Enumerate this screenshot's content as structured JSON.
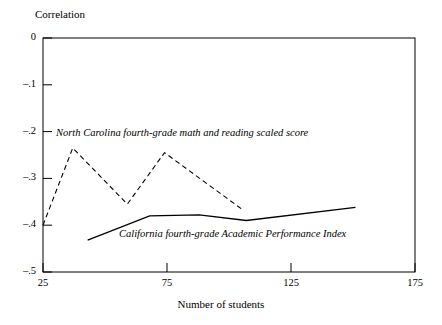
{
  "chart_data": {
    "type": "line",
    "title": "",
    "xlabel": "Number of students",
    "ylabel": "Correlation",
    "xlim": [
      25,
      175
    ],
    "ylim": [
      -0.5,
      0
    ],
    "grid": false,
    "legend_position": "inline-annotations",
    "xticks": [
      25,
      75,
      125,
      175
    ],
    "xtick_labels": [
      "25",
      "75",
      "125",
      "175"
    ],
    "yticks": [
      0,
      -0.1,
      -0.2,
      -0.3,
      -0.4,
      -0.5
    ],
    "ytick_labels": [
      "0",
      "–.1",
      "–.2",
      "–.3",
      "–.4",
      "–.5"
    ],
    "series": [
      {
        "name": "North Carolina fourth-grade math and reading scaled score",
        "style": "dashed",
        "color": "#000000",
        "x": [
          25,
          37,
          59,
          74,
          105
        ],
        "values": [
          -0.4,
          -0.235,
          -0.355,
          -0.245,
          -0.365
        ]
      },
      {
        "name": "California fourth-grade Academic Performance Index",
        "style": "solid",
        "color": "#000000",
        "x": [
          43,
          68,
          88,
          107,
          151
        ],
        "values": [
          -0.432,
          -0.38,
          -0.378,
          -0.39,
          -0.362
        ]
      }
    ],
    "annotations": [
      {
        "text": "North Carolina fourth-grade math and reading scaled score",
        "series": "North Carolina fourth-grade math and reading scaled score"
      },
      {
        "text": "California fourth-grade Academic Performance Index",
        "series": "California fourth-grade Academic Performance Index"
      }
    ]
  },
  "axes": {
    "y_axis_title": "Correlation",
    "x_axis_title": "Number of students",
    "ytick_labels": [
      "0",
      "–.1",
      "–.2",
      "–.3",
      "–.4",
      "–.5"
    ],
    "xtick_labels": [
      "25",
      "75",
      "125",
      "175"
    ]
  }
}
